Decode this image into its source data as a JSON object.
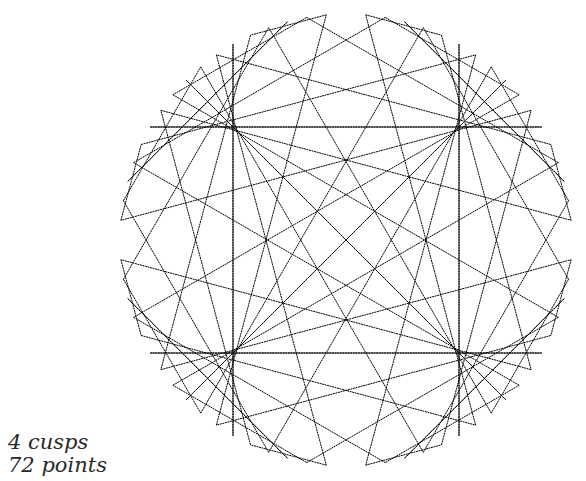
{
  "diagram": {
    "type": "modular-multiplication-chord-diagram",
    "points": 72,
    "multiplier": 5,
    "cusps": 4,
    "circle": {
      "cx": 346,
      "cy": 240,
      "r": 226
    },
    "start_angle_deg": 0,
    "line_color": "#000000",
    "background": "#ffffff"
  },
  "captions": {
    "cusps": "4 cusps",
    "points": "72 points"
  }
}
